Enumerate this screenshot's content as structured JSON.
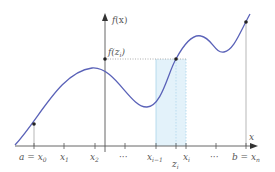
{
  "diagram": {
    "colors": {
      "curve": "#5a62b8",
      "axis": "#555555",
      "shade": "#e3f2fa",
      "shade_edge": "#a9d4ea",
      "point": "#222222",
      "guide": "#999999"
    },
    "y_axis": {
      "label_base": "f",
      "label_arg": "(x)"
    },
    "x_axis": {
      "label": "x"
    },
    "sample_value_label": {
      "base": "f",
      "open": "(z",
      "sub": "i",
      "close": ")"
    },
    "ticks": [
      {
        "id": "x0",
        "main": "a = x",
        "sub": "0"
      },
      {
        "id": "x1",
        "main": "x",
        "sub": "1"
      },
      {
        "id": "x2",
        "main": "x",
        "sub": "2"
      },
      {
        "id": "dots1",
        "main": "···",
        "sub": ""
      },
      {
        "id": "xim1",
        "main": "x",
        "sub": "i−1"
      },
      {
        "id": "zi",
        "main": "z",
        "sub": "i"
      },
      {
        "id": "xi",
        "main": "x",
        "sub": "i"
      },
      {
        "id": "dots2",
        "main": "···",
        "sub": ""
      },
      {
        "id": "xn",
        "main": "b = x",
        "sub": "n"
      }
    ],
    "points": [
      {
        "name": "start-point",
        "label": "(a, f(a))"
      },
      {
        "name": "sample-point",
        "label": "(z_i, f(z_i))"
      },
      {
        "name": "end-point",
        "label": "(b, f(b))"
      }
    ]
  }
}
